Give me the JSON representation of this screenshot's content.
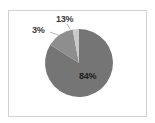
{
  "chart_data": {
    "type": "pie",
    "title": "",
    "subtitle": "",
    "xlabel": "",
    "ylabel": "",
    "legend": false,
    "legend_position": "none",
    "grid": false,
    "categories": [
      "Category A",
      "Category B",
      "Category C"
    ],
    "values": [
      84,
      13,
      3
    ],
    "labels": [
      "84%",
      "13%",
      "3%"
    ],
    "units": "percent",
    "total": 100,
    "start_angle_deg": 0,
    "direction": "clockwise",
    "slices": [
      {
        "label": "84%",
        "value": 84,
        "color": "#757575",
        "label_position": "inside",
        "start_angle_deg": 0,
        "end_angle_deg": 302.4
      },
      {
        "label": "3%",
        "value": 3,
        "color": "#8e8e8e",
        "label_position": "outside",
        "start_angle_deg": 302.4,
        "end_angle_deg": 313.2
      },
      {
        "label": "13%",
        "value": 13,
        "color": "#c9c9c9",
        "label_position": "outside",
        "start_angle_deg": 313.2,
        "end_angle_deg": 360
      }
    ],
    "colors": [
      "#757575",
      "#8e8e8e",
      "#c9c9c9"
    ],
    "background": "#ffffff",
    "frame_color": "#d2d2d2"
  },
  "figure": {
    "frame_visible": true,
    "pie_center_x": 79,
    "pie_center_y": 63,
    "pie_radius": 34
  }
}
